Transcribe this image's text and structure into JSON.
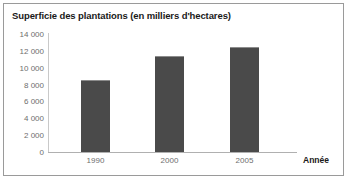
{
  "chart_data": {
    "type": "bar",
    "title": "Superficie des plantations (en milliers d'hectares)",
    "xlabel": "Année",
    "ylabel": "",
    "categories": [
      "1990",
      "2000",
      "2005"
    ],
    "values": [
      8600,
      11400,
      12400
    ],
    "ylim": [
      0,
      14000
    ],
    "ytick_labels": [
      "14 000",
      "12 000",
      "10 000",
      "8 000",
      "6 000",
      "4 000",
      "2 000",
      "0"
    ],
    "ytick_values": [
      14000,
      12000,
      10000,
      8000,
      6000,
      4000,
      2000,
      0
    ],
    "grid": false,
    "legend": null,
    "series_color": "#4a4a4a",
    "axis_color": "#c9c9c9",
    "tick_text_color": "#6e6e6e"
  }
}
